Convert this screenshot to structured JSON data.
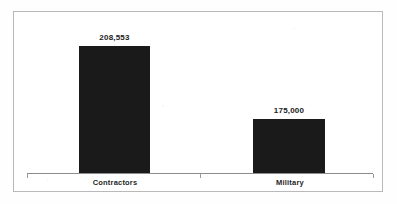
{
  "chart_data": {
    "type": "bar",
    "title": "",
    "subtitle": "",
    "xlabel": "",
    "ylabel": "",
    "categories": [
      "Contractors",
      "Military"
    ],
    "values": [
      208553,
      175000
    ],
    "value_labels": [
      "208,553",
      "175,000"
    ],
    "series": [
      {
        "name": "",
        "values": [
          208553,
          175000
        ],
        "color": "#1a1a1a"
      }
    ],
    "grid": false,
    "legend": false,
    "legend_position": "none",
    "axis": {
      "y_axis_visible": false,
      "y_tick_labels": [],
      "x_axis_visible": true,
      "x_tick_labels": [
        "Contractors",
        "Military"
      ]
    },
    "annotations": []
  },
  "figure": {
    "border_color": "#b9b9b9",
    "background_color": "#ffffff",
    "bar_color": "#1a1a1a",
    "axis_color": "#8d8d8d",
    "label_color": "#222222"
  }
}
